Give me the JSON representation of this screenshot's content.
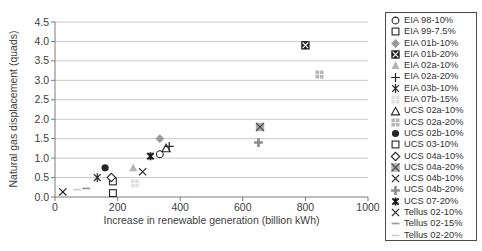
{
  "chart_data": {
    "type": "scatter",
    "title": "",
    "xlabel": "Increase in renewable generation (billion kWh)",
    "ylabel": "Natural gas displacement (quads)",
    "xlim": [
      0,
      1000
    ],
    "ylim": [
      0,
      4.5
    ],
    "x_ticks": [
      0,
      200,
      400,
      600,
      800,
      1000
    ],
    "y_tick_labels": [
      "0.0",
      "0.5",
      "1.0",
      "1.5",
      "2.0",
      "2.5",
      "3.0",
      "3.5",
      "4.0",
      "4.5"
    ],
    "grid": "horizontal gridlines every 0.5 quads",
    "legend_position": "right",
    "colors": {
      "axis": "#7a7a7a",
      "grid": "#c9c9c9",
      "text": "#404040",
      "black": "#262626"
    },
    "series": [
      {
        "name": "EIA 98-10%",
        "marker": "circle-open",
        "color": "#262626",
        "x": 335,
        "y": 1.1
      },
      {
        "name": "EIA 99-7.5%",
        "marker": "square-open",
        "color": "#262626",
        "x": 185,
        "y": 0.1
      },
      {
        "name": "EIA 01b-10%",
        "marker": "diamond-filled",
        "color": "#9a9a9a",
        "x": 335,
        "y": 1.5
      },
      {
        "name": "EIA 01b-20%",
        "marker": "square-black-x",
        "color": "#1f1f1f",
        "x": 800,
        "y": 3.9
      },
      {
        "name": "EIA 02a-10%",
        "marker": "triangle-filled",
        "color": "#b5b5b5",
        "x": 250,
        "y": 0.75
      },
      {
        "name": "EIA 02a-20%",
        "marker": "plus-thin",
        "color": "#262626",
        "x": 365,
        "y": 1.3
      },
      {
        "name": "EIA 03b-10%",
        "marker": "star6-thin",
        "color": "#262626",
        "x": 135,
        "y": 0.5
      },
      {
        "name": "EIA 07b-15%",
        "marker": "square-4pane",
        "color": "#e0e0e0",
        "x": 255,
        "y": 0.35
      },
      {
        "name": "UCS 02a-10%",
        "marker": "triangle-open",
        "color": "#262626",
        "x": 355,
        "y": 1.25
      },
      {
        "name": "UCS 02a-20%",
        "marker": "square-4pane",
        "color": "#b5b5b5",
        "x": 845,
        "y": 3.15
      },
      {
        "name": "UCS 02b-10%",
        "marker": "circle-filled",
        "color": "#262626",
        "x": 160,
        "y": 0.75
      },
      {
        "name": "UCS 03-10%",
        "marker": "square-open",
        "color": "#262626",
        "x": 185,
        "y": 0.4
      },
      {
        "name": "UCS 04a-10%",
        "marker": "diamond-open",
        "color": "#262626",
        "x": 180,
        "y": 0.5
      },
      {
        "name": "UCS 04a-20%",
        "marker": "square-gray-x",
        "color": "#b0b0b0",
        "x": 655,
        "y": 1.8
      },
      {
        "name": "UCS 04b-10%",
        "marker": "x-thin",
        "color": "#262626",
        "x": 280,
        "y": 0.65
      },
      {
        "name": "UCS 04b-20%",
        "marker": "plus-bold",
        "color": "#8c8c8c",
        "x": 650,
        "y": 1.4
      },
      {
        "name": "UCS 07-20%",
        "marker": "star6-bold",
        "color": "#1a1a1a",
        "x": 305,
        "y": 1.05
      },
      {
        "name": "Tellus 02-10%",
        "marker": "x-thin",
        "color": "#262626",
        "x": 25,
        "y": 0.13
      },
      {
        "name": "Tellus 02-15%",
        "marker": "dash",
        "color": "#9a9a9a",
        "x": 100,
        "y": 0.22
      },
      {
        "name": "Tellus 02-20%",
        "marker": "dash",
        "color": "#cdcdcd",
        "x": 70,
        "y": 0.19
      }
    ]
  }
}
